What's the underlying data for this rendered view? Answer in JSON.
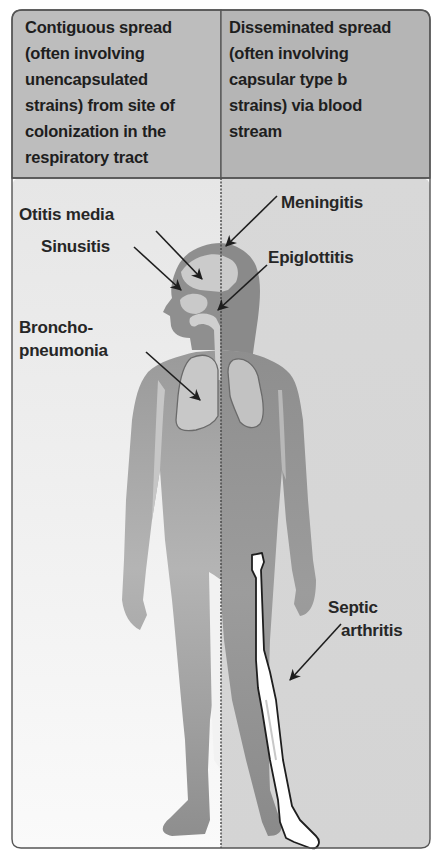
{
  "figure": {
    "columns": [
      {
        "id": "contiguous",
        "header_lines": [
          "Contiguous spread",
          "(often involving",
          "unencapsulated",
          "strains) from site of",
          "colonization in the",
          "respiratory tract"
        ],
        "background": "#f4f4f4",
        "header_background": "#bdbdbd"
      },
      {
        "id": "disseminated",
        "header_lines": [
          "Disseminated spread",
          "(often involving",
          "capsular type b",
          "strains) via blood",
          "stream"
        ],
        "background": "#dcdcdc",
        "header_background": "#b4b4b4"
      }
    ],
    "labels": {
      "otitis_media": "Otitis media",
      "sinusitis": "Sinusitis",
      "bronchopneumonia_line1": "Broncho-",
      "bronchopneumonia_line2": "pneumonia",
      "meningitis": "Meningitis",
      "epiglottitis": "Epiglottitis",
      "septic_arthritis_line1": "Septic",
      "septic_arthritis_line2": "arthritis"
    },
    "colors": {
      "frame": "#555555",
      "body_light": "#a8a8a8",
      "body_dark": "#8c8c8c",
      "organ": "#c8c8c8",
      "bone": "#ffffff",
      "arrow": "#222222"
    }
  }
}
